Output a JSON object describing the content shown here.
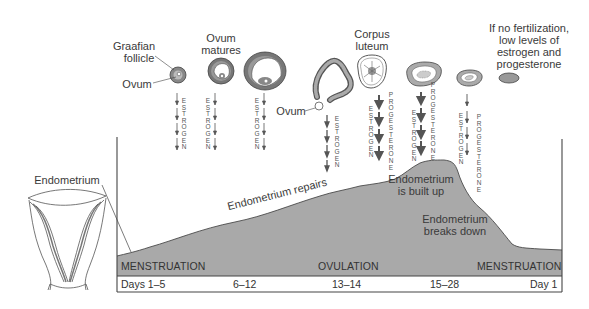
{
  "diagram": {
    "colors": {
      "endometrium_fill": "#a9a9a9",
      "line": "#444444",
      "text": "#333333",
      "background": "#ffffff"
    },
    "ovary_labels": {
      "graafian_follicle": "Graafian\nfollicle",
      "graafian_line1": "Graafian",
      "graafian_line2": "follicle",
      "ovum_left": "Ovum",
      "ovum_matures_line1": "Ovum",
      "ovum_matures_line2": "matures",
      "ovum_released": "Ovum",
      "corpus_luteum_line1": "Corpus",
      "corpus_luteum_line2": "luteum",
      "no_fertilization_line1": "If no fertilization,",
      "no_fertilization_line2": "low levels of",
      "no_fertilization_line3": "estrogen and",
      "no_fertilization_line4": "progesterone"
    },
    "hormone_columns": [
      {
        "stage": "graafian-follicle",
        "hormones": [
          "ESTROGEN"
        ]
      },
      {
        "stage": "ovum-matures",
        "hormones": [
          "ESTROGEN"
        ]
      },
      {
        "stage": "mature-follicle",
        "hormones": [
          "ESTROGEN"
        ]
      },
      {
        "stage": "ovulation",
        "hormones": [
          "ESTROGEN"
        ]
      },
      {
        "stage": "corpus-luteum",
        "hormones": [
          "ESTROGEN",
          "PROGESTERONE"
        ]
      },
      {
        "stage": "corpus-luteum-2",
        "hormones": [
          "ESTROGEN",
          "PROGESTERONE"
        ]
      },
      {
        "stage": "corpus-luteum-regressing",
        "hormones": [
          "ESTROGEN",
          "PROGESTERONE"
        ]
      }
    ],
    "hormone_text": {
      "estrogen": "ESTROGEN",
      "progesterone": "PROGESTERONE",
      "progesterone_partial": "PROGESTERONE"
    },
    "endometrium_label": "Endometrium",
    "curve_annotations": {
      "repairs": "Endometrium repairs",
      "built_up_line1": "Endometrium",
      "built_up_line2": "is built up",
      "breaks_down_line1": "Endometrium",
      "breaks_down_line2": "breaks down"
    },
    "phases": {
      "menstruation_start": "MENSTRUATION",
      "ovulation": "OVULATION",
      "menstruation_end": "MENSTRUATION"
    },
    "days": [
      "Days 1–5",
      "6–12",
      "13–14",
      "15–28",
      "Day 1"
    ]
  }
}
